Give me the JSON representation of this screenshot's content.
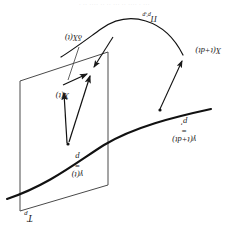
{
  "figure": {
    "domain_type": "math-diagram",
    "background_color": "#ffffff",
    "stroke_color": "#1a1a1a",
    "artifact_text": "· ·· ···· ··  ··   ···  ·· ····   ·   ···"
  },
  "labels": {
    "tangent_space": {
      "text": "T",
      "subscript": "p",
      "x": 196,
      "y": 14
    },
    "point_p": {
      "line1": "γ(t)",
      "line2": "=",
      "line3": "p",
      "x": 146,
      "y": 58
    },
    "point_p_prime": {
      "line1": "γ(t+dt)",
      "line2": "=",
      "line3": "p′",
      "x": 33,
      "y": 93
    },
    "vector_x_t": {
      "text": "X(t)",
      "x": 160,
      "y": 137
    },
    "vector_delta_x": {
      "text": "δX(t)",
      "x": 147,
      "y": 195
    },
    "vector_x_t_dt": {
      "text": "X(t+dt)",
      "x": 8,
      "y": 182
    },
    "transport_operator": {
      "text": "Π",
      "subscript": "p′,p",
      "x": 72,
      "y": 214
    }
  },
  "geometry": {
    "plane_name": "tangent-plane",
    "plane_points": "121,52 209,26 209,156 121,185",
    "curve_name": "manifold-curve",
    "curve_path": "M 18,128 C 55,120 95,110 125,92 C 152,75 180,52 222,38",
    "transport_arc_name": "parallel-transport-arc",
    "transport_arc_path": "M 46,182 C 64,218 100,228 128,208 C 146,195 158,186 168,180",
    "vectors": [
      {
        "name": "transported-vector",
        "from": [
          160,
          95
        ],
        "to": [
          138,
          162
        ]
      },
      {
        "name": "original-vector-x",
        "from": [
          162,
          94
        ],
        "to": [
          165,
          145
        ]
      },
      {
        "name": "delta-vector",
        "from": [
          166,
          152
        ],
        "to": [
          140,
          164
        ]
      },
      {
        "name": "transport-mapping-arrow",
        "from": [
          69,
          128
        ],
        "to": [
          46,
          177
        ]
      },
      {
        "name": "transport-result-arrow",
        "from": [
          116,
          200
        ],
        "to": [
          136,
          169
        ]
      }
    ],
    "leader_line": {
      "name": "delta-x-leader",
      "from": [
        150,
        190
      ],
      "to": [
        160,
        158
      ]
    }
  }
}
